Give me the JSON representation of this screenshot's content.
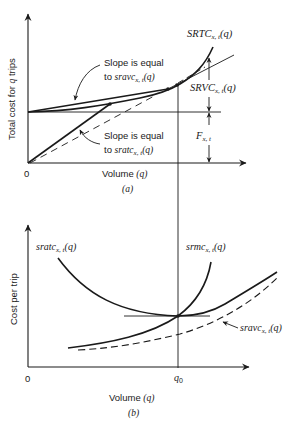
{
  "panel_a": {
    "caption": "(a)",
    "y_axis_label": "Total cost for q trips",
    "y_axis_label_parts": {
      "pre": "Total cost for ",
      "var": "q",
      "post": " trips"
    },
    "x_axis_label_pre": "Volume ",
    "x_axis_label_var": "(q)",
    "origin_label": "0",
    "srtc": {
      "main": "SRTC",
      "sub": "x, t",
      "arg": "(q)"
    },
    "srvc": {
      "main": "SRVC",
      "sub": "x, t",
      "arg": "(q)"
    },
    "fixed": {
      "main": "F",
      "sub": "x, t"
    },
    "annotation_sravc": {
      "line1": "Slope is equal",
      "line2_pre": "to ",
      "fn": "sravc",
      "sub": "x, t",
      "arg": "(q)"
    },
    "annotation_sratc": {
      "line1": "Slope is equal",
      "line2_pre": "to ",
      "fn": "sratc",
      "sub": "x, t",
      "arg": "(q)"
    }
  },
  "panel_b": {
    "caption": "(b)",
    "y_axis_label": "Cost per trip",
    "x_axis_label_pre": "Volume ",
    "x_axis_label_var": "(q)",
    "origin_label": "0",
    "q0_label": {
      "main": "q",
      "sub": "0"
    },
    "sratc": {
      "main": "sratc",
      "sub": "x, t",
      "arg": "(q)"
    },
    "srmc": {
      "main": "srmc",
      "sub": "x, t",
      "arg": "(q)"
    },
    "sravc": {
      "main": "sravc",
      "sub": "x, t",
      "arg": "(q)"
    }
  },
  "colors": {
    "ink": "#1a1a1a",
    "background": "#ffffff"
  }
}
